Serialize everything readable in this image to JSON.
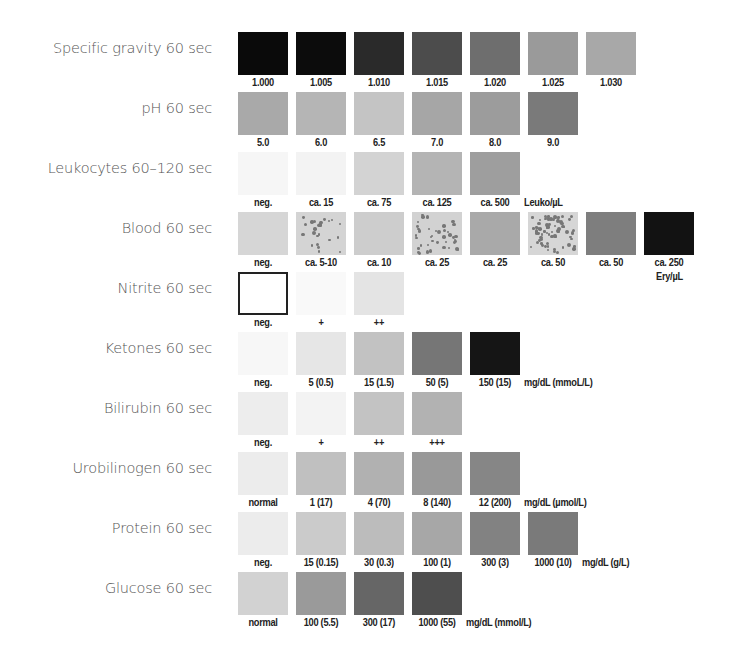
{
  "rows": [
    {
      "label": "Specific gravity 60 sec",
      "unit": "",
      "pads": [
        {
          "value": "1.000",
          "color": "#0a0a0a"
        },
        {
          "value": "1.005",
          "color": "#0c0c0c"
        },
        {
          "value": "1.010",
          "color": "#2a2a2a"
        },
        {
          "value": "1.015",
          "color": "#4c4c4c"
        },
        {
          "value": "1.020",
          "color": "#6e6e6e"
        },
        {
          "value": "1.025",
          "color": "#9a9a9a"
        },
        {
          "value": "1.030",
          "color": "#a8a8a8"
        }
      ]
    },
    {
      "label": "pH 60 sec",
      "unit": "",
      "pads": [
        {
          "value": "5.0",
          "color": "#a9a9a9"
        },
        {
          "value": "6.0",
          "color": "#b5b5b5"
        },
        {
          "value": "6.5",
          "color": "#c4c4c4"
        },
        {
          "value": "7.0",
          "color": "#a6a6a6"
        },
        {
          "value": "8.0",
          "color": "#9c9c9c"
        },
        {
          "value": "9.0",
          "color": "#7a7a7a"
        }
      ]
    },
    {
      "label": "Leukocytes 60–120 sec",
      "unit": "Leuko/µL",
      "pads": [
        {
          "value": "neg.",
          "color": "#f6f6f6"
        },
        {
          "value": "ca. 15",
          "color": "#f3f3f3"
        },
        {
          "value": "ca. 75",
          "color": "#d3d3d3"
        },
        {
          "value": "ca. 125",
          "color": "#b4b4b4"
        },
        {
          "value": "ca. 500",
          "color": "#9e9e9e"
        }
      ]
    },
    {
      "label": "Blood 60 sec",
      "unit": "Ery/µL",
      "pads": [
        {
          "value": "neg.",
          "color": "#d6d6d6",
          "speckles": 0
        },
        {
          "value": "ca. 5-10",
          "color": "#d4d4d4",
          "speckles": 24
        },
        {
          "value": "ca. 10",
          "color": "#cdcdcd",
          "speckles": 0
        },
        {
          "value": "ca. 25",
          "color": "#d2d2d2",
          "speckles": 40
        },
        {
          "value": "ca. 25",
          "color": "#a9a9a9",
          "speckles": 0
        },
        {
          "value": "ca. 50",
          "color": "#d6d6d6",
          "speckles": 70
        },
        {
          "value": "ca. 50",
          "color": "#7e7e7e",
          "speckles": 0
        },
        {
          "value": "ca. 250",
          "color": "#121212",
          "speckles": 0
        }
      ]
    },
    {
      "label": "Nitrite 60 sec",
      "unit": "",
      "pads": [
        {
          "value": "neg.",
          "color": "#ffffff",
          "outlined": true
        },
        {
          "value": "+",
          "color": "#f9f9f9"
        },
        {
          "value": "++",
          "color": "#e4e4e4"
        }
      ]
    },
    {
      "label": "Ketones 60 sec",
      "unit": "mg/dL (mmoL/L)",
      "pads": [
        {
          "value": "neg.",
          "color": "#f7f7f7"
        },
        {
          "value": "5 (0.5)",
          "color": "#e6e6e6"
        },
        {
          "value": "15 (1.5)",
          "color": "#c2c2c2"
        },
        {
          "value": "50 (5)",
          "color": "#767676"
        },
        {
          "value": "150 (15)",
          "color": "#151515"
        }
      ]
    },
    {
      "label": "Bilirubin 60 sec",
      "unit": "",
      "pads": [
        {
          "value": "neg.",
          "color": "#ededed"
        },
        {
          "value": "+",
          "color": "#f3f3f3"
        },
        {
          "value": "++",
          "color": "#c3c3c3"
        },
        {
          "value": "+++",
          "color": "#b2b2b2"
        }
      ]
    },
    {
      "label": "Urobilinogen 60 sec",
      "unit": "mg/dL (µmol/L)",
      "pads": [
        {
          "value": "normal",
          "color": "#ececec"
        },
        {
          "value": "1 (17)",
          "color": "#c0c0c0"
        },
        {
          "value": "4 (70)",
          "color": "#b1b1b1"
        },
        {
          "value": "8 (140)",
          "color": "#999999"
        },
        {
          "value": "12 (200)",
          "color": "#868686"
        }
      ]
    },
    {
      "label": "Protein 60 sec",
      "unit": "mg/dL (g/L)",
      "pads": [
        {
          "value": "neg.",
          "color": "#ececec"
        },
        {
          "value": "15 (0.15)",
          "color": "#cbcbcb"
        },
        {
          "value": "30 (0.3)",
          "color": "#bcbcbc"
        },
        {
          "value": "100 (1)",
          "color": "#a7a7a7"
        },
        {
          "value": "300 (3)",
          "color": "#828282"
        },
        {
          "value": "1000 (10)",
          "color": "#7a7a7a"
        }
      ]
    },
    {
      "label": "Glucose 60 sec",
      "unit": "mg/dL (mmol/L)",
      "pads": [
        {
          "value": "normal",
          "color": "#d2d2d2"
        },
        {
          "value": "100 (5.5)",
          "color": "#9a9a9a"
        },
        {
          "value": "300 (17)",
          "color": "#666666"
        },
        {
          "value": "1000 (55)",
          "color": "#4e4e4e"
        }
      ]
    }
  ]
}
